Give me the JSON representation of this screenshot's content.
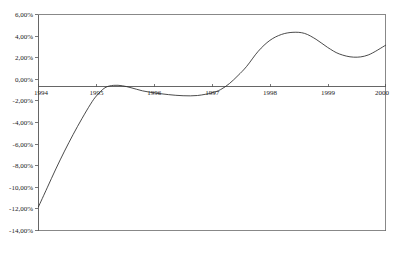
{
  "chart_data": {
    "type": "line",
    "title": "",
    "subtitle": "",
    "xlabel": "",
    "ylabel": "",
    "grid": false,
    "legend": null,
    "legend_position": "none",
    "decimal_separator": ",",
    "xlim": [
      1994,
      2000
    ],
    "ylim": [
      -14,
      6
    ],
    "y_tick_labels": [
      "6,00%",
      "4,00%",
      "2,00%",
      "0,00%",
      "-2,00%",
      "-4,00%",
      "-6,00%",
      "-8,00%",
      "-10,00%",
      "-12,00%",
      "-14,00%"
    ],
    "y_tick_values": [
      6,
      4,
      2,
      0,
      -2,
      -4,
      -6,
      -8,
      -10,
      -12,
      -14
    ],
    "x_tick_labels": [
      "1994",
      "1995",
      "1996",
      "1997",
      "1998",
      "1999",
      "2000"
    ],
    "x_tick_values": [
      1994,
      1995,
      1996,
      1997,
      1998,
      1999,
      2000
    ],
    "categories": [
      "1994",
      "1995",
      "1996",
      "1997",
      "1998",
      "1999",
      "2000"
    ],
    "values": [
      -11.8,
      -0.7,
      -1.3,
      -1.4,
      4.3,
      2.05,
      3.15
    ],
    "series": [
      {
        "name": "",
        "color": "#2b2b2b",
        "x": [
          1994.0,
          1994.15,
          1994.3,
          1994.45,
          1994.6,
          1994.75,
          1994.9,
          1995.0,
          1995.15,
          1995.3,
          1995.45,
          1995.6,
          1995.8,
          1996.0,
          1996.25,
          1996.5,
          1996.75,
          1997.0,
          1997.15,
          1997.3,
          1997.45,
          1997.6,
          1997.8,
          1998.0,
          1998.2,
          1998.4,
          1998.6,
          1998.8,
          1999.0,
          1999.2,
          1999.45,
          1999.7,
          2000.0
        ],
        "y": [
          -11.8,
          -10.05,
          -8.3,
          -6.65,
          -5.1,
          -3.65,
          -2.3,
          -1.55,
          -0.78,
          -0.56,
          -0.6,
          -0.78,
          -1.07,
          -1.25,
          -1.42,
          -1.52,
          -1.5,
          -1.25,
          -0.95,
          -0.4,
          0.35,
          1.2,
          2.6,
          3.6,
          4.15,
          4.35,
          4.25,
          3.7,
          2.95,
          2.35,
          2.05,
          2.25,
          3.15
        ]
      }
    ],
    "annotations": []
  },
  "axes": {
    "y_axis_name": "percentage-axis",
    "x_axis_name": "year-axis",
    "zero_line_value": "0,00%"
  }
}
